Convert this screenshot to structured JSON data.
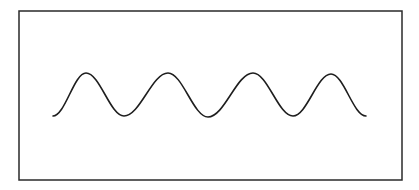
{
  "diagram": {
    "background_color": "#ffffff",
    "frame": {
      "x": 19,
      "y": 11,
      "width": 383,
      "height": 169,
      "stroke": "#2a2a2a",
      "stroke_width": 1.5
    },
    "wave": {
      "stroke": "#1e1e1e",
      "stroke_width": 1.6,
      "start": {
        "x": 53,
        "y": 116
      },
      "end": {
        "x": 366,
        "y": 116
      },
      "peaks": [
        {
          "x": 86,
          "y": 73
        },
        {
          "x": 168,
          "y": 73
        },
        {
          "x": 253,
          "y": 73
        },
        {
          "x": 331,
          "y": 74
        }
      ],
      "troughs": [
        {
          "x": 124,
          "y": 116
        },
        {
          "x": 208,
          "y": 117
        },
        {
          "x": 293,
          "y": 116
        }
      ],
      "cycles": 4
    }
  }
}
